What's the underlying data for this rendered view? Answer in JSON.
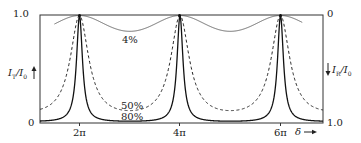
{
  "chart_data": {
    "type": "line",
    "title": "",
    "xlabel": "δ",
    "ylabel_left": "I_T/I_0",
    "ylabel_right": "I_R/I_0",
    "left_ticks": [
      "1.0",
      "0"
    ],
    "right_ticks": [
      "0",
      "1.0"
    ],
    "x_ticks": [
      "2π",
      "4π",
      "6π"
    ],
    "x_tick_values": [
      6.2832,
      12.5664,
      18.8496
    ],
    "xlim": [
      4.0,
      21.0
    ],
    "ylim": [
      0,
      1.0
    ],
    "right_axis_inverted": true,
    "grid": false,
    "legend": "inline curve labels",
    "series": [
      {
        "name": "4%",
        "reflectivity": 0.04,
        "style": "solid-thin",
        "min_transmission": 0.852,
        "max_transmission": 1.0
      },
      {
        "name": "50%",
        "reflectivity": 0.5,
        "style": "dashed",
        "min_transmission": 0.111,
        "max_transmission": 1.0
      },
      {
        "name": "80%",
        "reflectivity": 0.8,
        "style": "solid",
        "min_transmission": 0.012,
        "max_transmission": 1.0
      }
    ],
    "annotations": [
      "4%",
      "50%",
      "80%"
    ]
  },
  "labels": {
    "left_top": "1.0",
    "left_bottom": "0",
    "right_top": "0",
    "right_bottom": "1.0",
    "x_2pi": "2π",
    "x_4pi": "4π",
    "x_6pi": "6π",
    "delta": "δ",
    "arrow_right": "→",
    "curve_4": "4%",
    "curve_50": "50%",
    "curve_80": "80%"
  },
  "colors": {
    "line": "#222222",
    "frame": "#333333",
    "background": "#ffffff"
  }
}
